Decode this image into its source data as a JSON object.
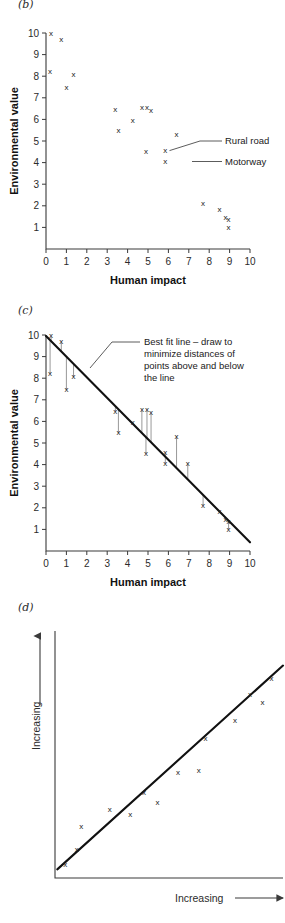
{
  "figure": {
    "panels": [
      {
        "id": "b",
        "label": "(b)"
      },
      {
        "id": "c",
        "label": "(c)"
      },
      {
        "id": "d",
        "label": "(d)"
      }
    ]
  },
  "chart_data": [
    {
      "type": "scatter",
      "panel": "(b)",
      "title": "",
      "xlabel": "Human impact",
      "ylabel": "Environmental value",
      "xlim": [
        0,
        10
      ],
      "ylim": [
        0,
        10
      ],
      "xticks": [
        "0",
        "1",
        "2",
        "3",
        "4",
        "5",
        "6",
        "7",
        "8",
        "9",
        "10"
      ],
      "yticks": [
        "1",
        "2",
        "3",
        "4",
        "5",
        "6",
        "7",
        "8",
        "9",
        "10"
      ],
      "grid": false,
      "marker": "x",
      "points": [
        {
          "x": 0.25,
          "y": 9.95
        },
        {
          "x": 0.75,
          "y": 9.7
        },
        {
          "x": 0.2,
          "y": 8.2
        },
        {
          "x": 1.35,
          "y": 8.05
        },
        {
          "x": 1.0,
          "y": 7.45
        },
        {
          "x": 3.4,
          "y": 6.45
        },
        {
          "x": 3.55,
          "y": 5.45
        },
        {
          "x": 4.25,
          "y": 5.95
        },
        {
          "x": 4.7,
          "y": 6.55
        },
        {
          "x": 4.95,
          "y": 6.55
        },
        {
          "x": 5.15,
          "y": 6.4
        },
        {
          "x": 4.9,
          "y": 4.5
        },
        {
          "x": 5.85,
          "y": 4.55
        },
        {
          "x": 5.85,
          "y": 4.05
        },
        {
          "x": 6.4,
          "y": 5.3
        },
        {
          "x": 7.7,
          "y": 2.1
        },
        {
          "x": 8.5,
          "y": 1.8
        },
        {
          "x": 8.8,
          "y": 1.45
        },
        {
          "x": 8.95,
          "y": 1.35
        },
        {
          "x": 8.95,
          "y": 1.0
        }
      ],
      "annotations": [
        {
          "text": "Rural road",
          "anchor_x": 5.85,
          "anchor_y": 4.55
        },
        {
          "text": "Motorway",
          "anchor_x": 6.95,
          "anchor_y": 4.05
        }
      ],
      "legend_position": "inside-right"
    },
    {
      "type": "scatter",
      "panel": "(c)",
      "title": "",
      "xlabel": "Human impact",
      "ylabel": "Environmental value",
      "xlim": [
        0,
        10
      ],
      "ylim": [
        0,
        10
      ],
      "xticks": [
        "0",
        "1",
        "2",
        "3",
        "4",
        "5",
        "6",
        "7",
        "8",
        "9",
        "10"
      ],
      "yticks": [
        "1",
        "2",
        "3",
        "4",
        "5",
        "6",
        "7",
        "8",
        "9",
        "10"
      ],
      "grid": false,
      "marker": "x",
      "points": [
        {
          "x": 0.25,
          "y": 9.95
        },
        {
          "x": 0.75,
          "y": 9.7
        },
        {
          "x": 0.2,
          "y": 8.2
        },
        {
          "x": 1.35,
          "y": 8.05
        },
        {
          "x": 1.0,
          "y": 7.45
        },
        {
          "x": 3.4,
          "y": 6.45
        },
        {
          "x": 3.55,
          "y": 5.45
        },
        {
          "x": 4.25,
          "y": 5.95
        },
        {
          "x": 4.7,
          "y": 6.55
        },
        {
          "x": 4.95,
          "y": 6.55
        },
        {
          "x": 5.15,
          "y": 6.4
        },
        {
          "x": 4.9,
          "y": 4.5
        },
        {
          "x": 5.85,
          "y": 4.55
        },
        {
          "x": 5.85,
          "y": 4.05
        },
        {
          "x": 6.4,
          "y": 5.3
        },
        {
          "x": 6.95,
          "y": 4.05
        },
        {
          "x": 7.7,
          "y": 2.1
        },
        {
          "x": 8.5,
          "y": 1.8
        },
        {
          "x": 8.8,
          "y": 1.45
        },
        {
          "x": 8.95,
          "y": 1.35
        },
        {
          "x": 8.95,
          "y": 1.0
        }
      ],
      "fit_line": {
        "x0": 0.0,
        "y0": 9.95,
        "x1": 10.0,
        "y1": 0.4,
        "label": "Best fit line"
      },
      "residuals": true,
      "annotations": [
        {
          "text": "Best fit line – draw to"
        },
        {
          "text": "minimize distances of"
        },
        {
          "text": "points above and below"
        },
        {
          "text": "the line"
        }
      ]
    },
    {
      "type": "scatter",
      "panel": "(d)",
      "title": "",
      "xlabel": "Increasing",
      "ylabel": "Increasing",
      "xlim": [
        0,
        10
      ],
      "ylim": [
        0,
        10
      ],
      "xticks": [],
      "yticks": [],
      "grid": false,
      "marker": "x",
      "points": [
        {
          "x": 0.45,
          "y": 0.55
        },
        {
          "x": 0.95,
          "y": 1.15
        },
        {
          "x": 1.15,
          "y": 2.05
        },
        {
          "x": 2.4,
          "y": 2.75
        },
        {
          "x": 3.3,
          "y": 2.55
        },
        {
          "x": 3.9,
          "y": 3.45
        },
        {
          "x": 4.5,
          "y": 3.05
        },
        {
          "x": 5.4,
          "y": 4.25
        },
        {
          "x": 6.3,
          "y": 4.35
        },
        {
          "x": 6.6,
          "y": 5.65
        },
        {
          "x": 7.9,
          "y": 6.35
        },
        {
          "x": 8.55,
          "y": 7.4
        },
        {
          "x": 9.1,
          "y": 7.1
        },
        {
          "x": 9.5,
          "y": 8.05
        }
      ],
      "fit_line": {
        "x0": 0.1,
        "y0": 0.35,
        "x1": 10.0,
        "y1": 8.6
      }
    }
  ]
}
